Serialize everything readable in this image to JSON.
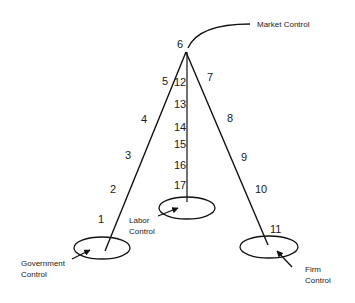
{
  "diagram": {
    "labels": {
      "market": "Market Control",
      "labor_line1": "Labor",
      "labor_line2": "Control",
      "government_line1": "Government",
      "government_line2": "Control",
      "firm_line1": "Firm",
      "firm_line2": "Control"
    },
    "left_leg_numbers": [
      "1",
      "2",
      "3",
      "4",
      "5"
    ],
    "apex_number": "6",
    "right_leg_numbers": [
      "7",
      "8",
      "9",
      "10",
      "11"
    ],
    "center_leg_numbers": [
      "12",
      "13",
      "14",
      "15",
      "16",
      "17"
    ],
    "colors": {
      "line": "#111111",
      "text": "#1a1a1a",
      "background": "#ffffff"
    }
  }
}
